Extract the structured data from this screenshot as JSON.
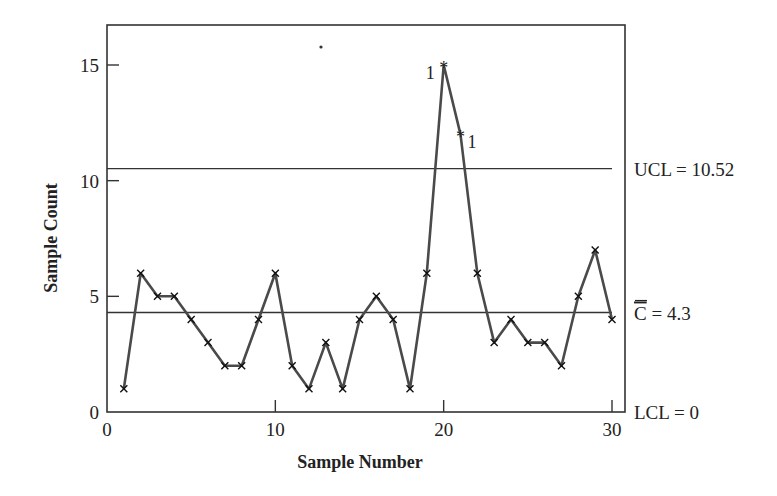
{
  "chart_data": {
    "type": "line",
    "title": "",
    "xlabel": "Sample Number",
    "ylabel": "Sample Count",
    "xlim": [
      0,
      30
    ],
    "ylim": [
      0,
      16.6
    ],
    "x_ticks": [
      0,
      10,
      20,
      30
    ],
    "y_ticks": [
      0,
      5,
      10,
      15
    ],
    "grid": false,
    "legend": null,
    "x": [
      1,
      2,
      3,
      4,
      5,
      6,
      7,
      8,
      9,
      10,
      11,
      12,
      13,
      14,
      15,
      16,
      17,
      18,
      19,
      20,
      21,
      22,
      23,
      24,
      25,
      26,
      27,
      28,
      29,
      30
    ],
    "series": [
      {
        "name": "Sample Count",
        "values": [
          1,
          6,
          5,
          5,
          4,
          3,
          2,
          2,
          4,
          6,
          2,
          1,
          3,
          1,
          4,
          5,
          4,
          1,
          6,
          15,
          12,
          6,
          3,
          4,
          3,
          3,
          2,
          5,
          7,
          4
        ],
        "marker": "x",
        "out_of_control_marker": "*"
      }
    ],
    "reference_lines": [
      {
        "name": "UCL",
        "value": 10.52,
        "label": "UCL = 10.52"
      },
      {
        "name": "CL",
        "value": 4.3,
        "label_symbol": "C",
        "label_rest": " = 4.3",
        "overbar": true
      },
      {
        "name": "LCL",
        "value": 0,
        "label": "LCL = 0"
      }
    ],
    "annotations": [
      {
        "x": 20,
        "y": 15,
        "text": "1",
        "position": "left"
      },
      {
        "x": 21,
        "y": 12,
        "text": "1",
        "position": "right"
      }
    ],
    "out_of_control_points": [
      20,
      21
    ]
  },
  "colors": {
    "line": "#4a4a4a",
    "frame": "#333333",
    "text": "#222222",
    "background": "#ffffff"
  }
}
